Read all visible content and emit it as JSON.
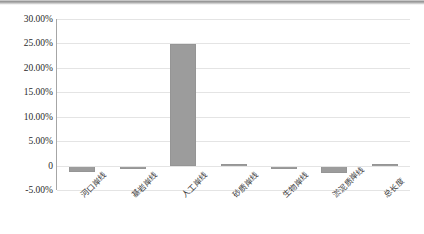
{
  "chart_data": {
    "type": "bar",
    "title": "",
    "subtitle": "",
    "xlabel": "",
    "ylabel": "",
    "grid": true,
    "legend": false,
    "ylim": [
      -0.05,
      0.3
    ],
    "ytick_labels": [
      "30.00%",
      "25.00%",
      "20.00%",
      "15.00%",
      "10.00%",
      "5.00%",
      "0",
      "-5.00%"
    ],
    "ytick_values": [
      0.3,
      0.25,
      0.2,
      0.15,
      0.1,
      0.05,
      0,
      -0.05
    ],
    "categories": [
      "河口岸线",
      "基岩岸线",
      "人工岸线",
      "砂质岸线",
      "生物岸线",
      "淤泥质岸线",
      "总长度"
    ],
    "values": [
      -0.0125,
      -0.0075,
      0.249,
      0.003,
      -0.005,
      -0.016,
      0.004
    ],
    "value_labels": [
      "-1.25%",
      "-0.75%",
      "24.90%",
      "0.30%",
      "-0.50%",
      "-1.60%",
      "0.40%"
    ],
    "series": [
      {
        "name": "",
        "values": [
          -0.0125,
          -0.0075,
          0.249,
          0.003,
          -0.005,
          -0.016,
          0.004
        ]
      }
    ],
    "bar_color": "#9c9c9c",
    "grid_color": "#e4e4e4",
    "axis_color": "#a6a6a6"
  }
}
